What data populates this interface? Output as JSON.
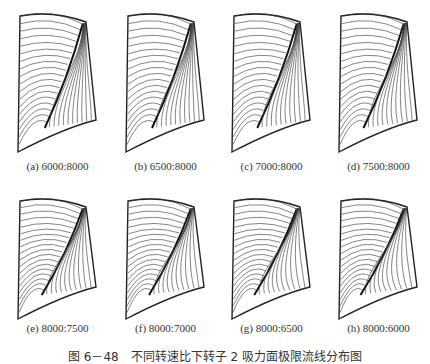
{
  "figure": {
    "caption": "图 6－48　不同转速比下转子 2 吸力面极限流线分布图",
    "panels": [
      {
        "label": "(a) 6000:8000",
        "ratio": [
          6000,
          8000
        ],
        "vortex": 0.55
      },
      {
        "label": "(b) 6500:8000",
        "ratio": [
          6500,
          8000
        ],
        "vortex": 0.6
      },
      {
        "label": "(c) 7000:8000",
        "ratio": [
          7000,
          8000
        ],
        "vortex": 0.65
      },
      {
        "label": "(d) 7500:8000",
        "ratio": [
          7500,
          8000
        ],
        "vortex": 0.7
      },
      {
        "label": "(e) 8000:7500",
        "ratio": [
          8000,
          7500
        ],
        "vortex": 0.75
      },
      {
        "label": "(f) 8000:7000",
        "ratio": [
          8000,
          7000
        ],
        "vortex": 0.8
      },
      {
        "label": "(g) 8000:6500",
        "ratio": [
          8000,
          6500
        ],
        "vortex": 0.85
      },
      {
        "label": "(h) 8000:6000",
        "ratio": [
          8000,
          6000
        ],
        "vortex": 0.9
      }
    ]
  }
}
